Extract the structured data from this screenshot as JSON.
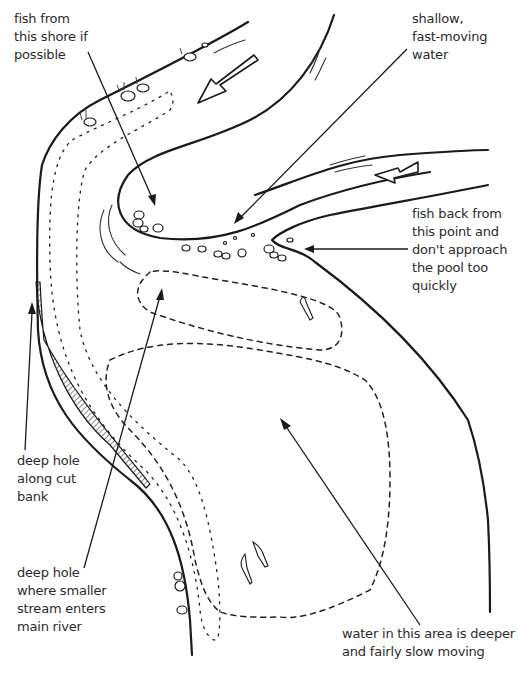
{
  "diagram": {
    "labels": {
      "fish_from_shore": "fish from\nthis shore if\npossible",
      "shallow_water": "shallow,\nfast-moving\nwater",
      "fish_back": "fish back from\nthis point and\ndon't approach\nthe pool too\nquickly",
      "deep_hole_cut_bank": "deep hole\nalong cut\nbank",
      "deep_hole_stream": "deep hole\nwhere smaller\nstream enters\nmain river",
      "deep_slow_water": "water in this area is deeper\nand fairly slow moving"
    },
    "icons": {
      "flow_arrow_main": "flow-direction-arrow",
      "flow_arrow_tributary": "flow-direction-arrow",
      "fish": "fish-icon",
      "rocks": "rock-icon"
    },
    "colors": {
      "ink": "#1a1a1a",
      "text": "#2b2b2b",
      "background": "#ffffff"
    }
  }
}
